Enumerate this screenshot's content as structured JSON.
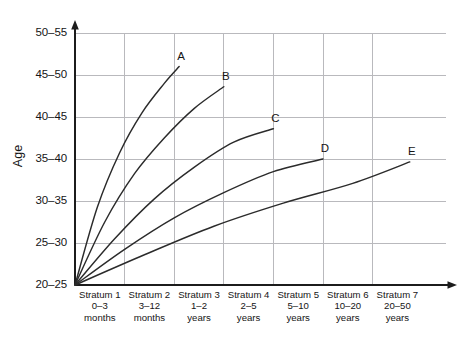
{
  "chart_data": {
    "type": "line",
    "title": "",
    "xlabel": "",
    "ylabel": "Age",
    "grid": true,
    "legend_position": "inline-end-labels",
    "x_categories": [
      {
        "name": "Stratum 1",
        "range": "0–3",
        "unit": "months"
      },
      {
        "name": "Stratum 2",
        "range": "3–12",
        "unit": "months"
      },
      {
        "name": "Stratum 3",
        "range": "1–2",
        "unit": "years"
      },
      {
        "name": "Stratum 4",
        "range": "2–5",
        "unit": "years"
      },
      {
        "name": "Stratum 5",
        "range": "5–10",
        "unit": "years"
      },
      {
        "name": "Stratum 6",
        "range": "10–20",
        "unit": "years"
      },
      {
        "name": "Stratum 7",
        "range": "20–50",
        "unit": "years"
      }
    ],
    "y_ticks": [
      "20–25",
      "25–30",
      "30–35",
      "35–40",
      "40–45",
      "45–50",
      "50–55"
    ],
    "ylim": [
      0,
      6
    ],
    "xlim": [
      0,
      7
    ],
    "series": [
      {
        "name": "A",
        "label": "A",
        "x": [
          0,
          0.45,
          0.9,
          1.35,
          1.8,
          2.1
        ],
        "y": [
          0,
          1.85,
          3.15,
          4.1,
          4.8,
          5.2
        ]
      },
      {
        "name": "B",
        "label": "B",
        "x": [
          0,
          0.6,
          1.2,
          1.8,
          2.4,
          3.0
        ],
        "y": [
          0,
          1.5,
          2.65,
          3.5,
          4.2,
          4.72
        ]
      },
      {
        "name": "C",
        "label": "C",
        "x": [
          0,
          0.8,
          1.6,
          2.4,
          3.2,
          4.0
        ],
        "y": [
          0,
          1.1,
          2.05,
          2.8,
          3.4,
          3.72
        ]
      },
      {
        "name": "D",
        "label": "D",
        "x": [
          0,
          1.0,
          2.0,
          3.0,
          4.0,
          5.0
        ],
        "y": [
          0,
          0.85,
          1.6,
          2.2,
          2.7,
          3.0
        ]
      },
      {
        "name": "E",
        "label": "E",
        "x": [
          0,
          1.4,
          2.8,
          4.2,
          5.6,
          6.75
        ],
        "y": [
          0,
          0.72,
          1.4,
          1.95,
          2.42,
          2.93
        ]
      }
    ]
  },
  "axis": {
    "y_title": "Age"
  }
}
